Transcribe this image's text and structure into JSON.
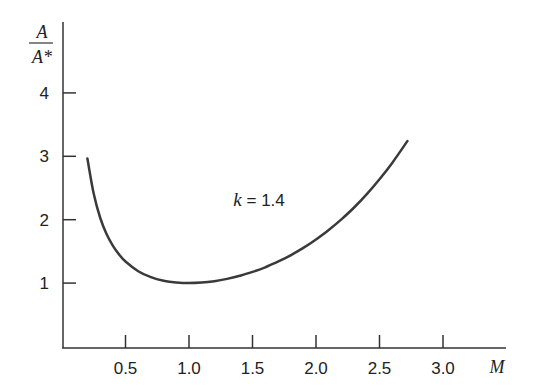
{
  "chart_data": {
    "type": "line",
    "title": "",
    "xlabel": "M",
    "ylabel": "A/A*",
    "ylabel_numerator": "A",
    "ylabel_denominator": "A*",
    "xlim": [
      0,
      3.5
    ],
    "ylim": [
      0,
      4.5
    ],
    "x_ticks": [
      0.5,
      1.0,
      1.5,
      2.0,
      2.5,
      3.0
    ],
    "x_tick_labels": [
      "0.5",
      "1.0",
      "1.5",
      "2.0",
      "2.5",
      "3.0"
    ],
    "y_ticks": [
      1,
      2,
      3,
      4
    ],
    "y_tick_labels": [
      "1",
      "2",
      "3",
      "4"
    ],
    "grid": false,
    "legend": null,
    "annotations": [
      {
        "text_var": "k",
        "text_rest": " = 1.4",
        "x": 1.05,
        "y": 2.6
      }
    ],
    "series": [
      {
        "name": "A/A* (k = 1.4)",
        "color": "#3a3a3a",
        "x": [
          0.2,
          0.25,
          0.3,
          0.35,
          0.4,
          0.45,
          0.5,
          0.6,
          0.7,
          0.8,
          0.9,
          1.0,
          1.1,
          1.2,
          1.3,
          1.4,
          1.5,
          1.6,
          1.7,
          1.8,
          1.9,
          2.0,
          2.1,
          2.2,
          2.3,
          2.4,
          2.5,
          2.6,
          2.72
        ],
        "values": [
          2.964,
          2.403,
          2.035,
          1.778,
          1.59,
          1.449,
          1.34,
          1.188,
          1.094,
          1.038,
          1.009,
          1.0,
          1.008,
          1.03,
          1.066,
          1.115,
          1.176,
          1.25,
          1.338,
          1.439,
          1.555,
          1.688,
          1.837,
          2.005,
          2.193,
          2.403,
          2.637,
          2.896,
          3.24
        ]
      }
    ]
  }
}
